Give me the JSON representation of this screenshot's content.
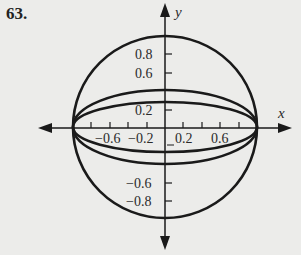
{
  "problem_number": "63.",
  "axes": {
    "x_label": "x",
    "y_label": "y"
  },
  "x_ticks": [
    {
      "label": "−0.6",
      "value": -0.6
    },
    {
      "label": "−0.2",
      "value": -0.2
    },
    {
      "label": "0.2",
      "value": 0.2
    },
    {
      "label": "0.6",
      "value": 0.6
    }
  ],
  "y_ticks": [
    {
      "label": "0.8",
      "value": 0.8
    },
    {
      "label": "0.6",
      "value": 0.6
    },
    {
      "label": "0.2",
      "value": 0.2
    },
    {
      "label": "−0.6",
      "value": -0.6
    },
    {
      "label": "−0.8",
      "value": -0.8
    }
  ],
  "curves": [
    {
      "name": "circle",
      "rx": 1.0,
      "ry": 1.0
    },
    {
      "name": "outer-ellipse",
      "rx": 1.0,
      "ry": 0.4
    },
    {
      "name": "inner-ellipse",
      "rx": 1.0,
      "ry": 0.27
    }
  ],
  "colors": {
    "ink": "#1a1a1a",
    "background": "#ececea"
  }
}
